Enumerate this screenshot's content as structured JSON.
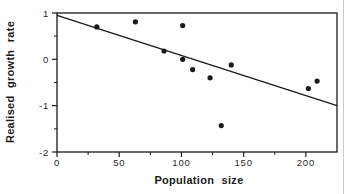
{
  "figure": {
    "background": "#ffffff",
    "scan_edge_color": "#cccccc"
  },
  "chart_data": {
    "type": "scatter",
    "title": "",
    "xlabel": "Population size",
    "ylabel": "Realised growth rate",
    "xlim": [
      0,
      225
    ],
    "ylim": [
      -2,
      1
    ],
    "grid": false,
    "legend": null,
    "x_major_ticks": [
      0,
      50,
      100,
      150,
      200
    ],
    "x_tick_labels": [
      "0",
      "50",
      "100",
      "150",
      "200"
    ],
    "x_minor_ticks": [
      25,
      75,
      125,
      175
    ],
    "y_major_ticks": [
      1,
      0,
      -1,
      -2
    ],
    "y_tick_labels": [
      "1",
      "0",
      "-1",
      "-2"
    ],
    "y_minor_ticks": [
      0.5,
      -0.5,
      -1.5
    ],
    "points": [
      {
        "x": 32,
        "y": 0.7
      },
      {
        "x": 63,
        "y": 0.81
      },
      {
        "x": 86,
        "y": 0.18
      },
      {
        "x": 101,
        "y": 0.73
      },
      {
        "x": 101,
        "y": 0.0
      },
      {
        "x": 109,
        "y": -0.22
      },
      {
        "x": 123,
        "y": -0.4
      },
      {
        "x": 132,
        "y": -1.43
      },
      {
        "x": 140,
        "y": -0.12
      },
      {
        "x": 202,
        "y": -0.63
      },
      {
        "x": 209,
        "y": -0.47
      }
    ],
    "trend_line": {
      "x1": 0,
      "y1": 0.95,
      "x2": 225,
      "y2": -1.0
    },
    "point_color": "#1a1a1a",
    "axis_color": "#1a1a1a"
  }
}
